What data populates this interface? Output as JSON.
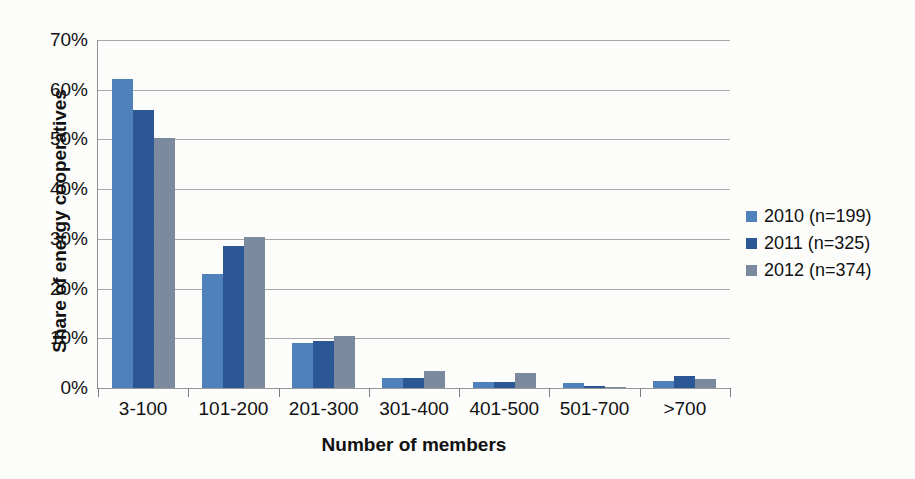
{
  "chart_data": {
    "type": "bar",
    "title": "",
    "subtitle": "",
    "xlabel": "Number of members",
    "ylabel": "Share of energy cooperatives",
    "categories": [
      "3-100",
      "101-200",
      "201-300",
      "301-400",
      "401-500",
      "501-700",
      ">700"
    ],
    "series": [
      {
        "name": "2010 (n=199)",
        "color": "#4f81bd",
        "values": [
          62.2,
          23.0,
          9.0,
          2.0,
          1.2,
          1.0,
          1.5
        ]
      },
      {
        "name": "2011 (n=325)",
        "color": "#2b5797",
        "values": [
          56.0,
          28.5,
          9.5,
          2.0,
          1.2,
          0.5,
          2.4
        ]
      },
      {
        "name": "2012 (n=374)",
        "color": "#7b8a9e",
        "values": [
          50.2,
          30.3,
          10.4,
          3.5,
          3.1,
          0.1,
          1.8
        ]
      }
    ],
    "ylim": [
      0,
      70
    ],
    "ytick_values": [
      0,
      10,
      20,
      30,
      40,
      50,
      60,
      70
    ],
    "ytick_labels": [
      "0%",
      "10%",
      "20%",
      "30%",
      "40%",
      "50%",
      "60%",
      "70%"
    ],
    "grid": true,
    "grid_axis": "y",
    "legend_position": "right",
    "value_unit": "percent"
  },
  "axes": {
    "y_title": "Share of energy cooperatives",
    "x_title": "Number of members"
  },
  "legend": {
    "entries": [
      {
        "label": "2010 (n=199)",
        "color": "#4f81bd"
      },
      {
        "label": "2011 (n=325)",
        "color": "#2b5797"
      },
      {
        "label": "2012 (n=374)",
        "color": "#7b8a9e"
      }
    ]
  },
  "colors": {
    "series_2010": "#4f81bd",
    "series_2011": "#2b5797",
    "series_2012": "#7b8a9e",
    "gridline": "#9a9a9a",
    "axis": "#8d8d8d",
    "text": "#111111",
    "background": "#fdfdfc"
  }
}
